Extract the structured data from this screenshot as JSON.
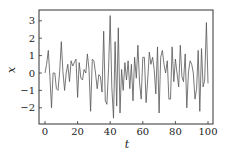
{
  "chart_data": {
    "type": "line",
    "title": "",
    "xlabel": "t",
    "ylabel": "x",
    "xlim": [
      -2,
      103
    ],
    "ylim": [
      -2.95,
      3.6
    ],
    "grid": false,
    "legend": null,
    "x_ticks": [
      0,
      20,
      40,
      60,
      80,
      100
    ],
    "x_tick_labels": [
      "0",
      "20",
      "40",
      "60",
      "80",
      "100"
    ],
    "y_ticks": [
      -2,
      -1,
      0,
      1,
      2,
      3
    ],
    "y_tick_labels": [
      "−2",
      "−1",
      "0",
      "1",
      "2",
      "3"
    ],
    "series": [
      {
        "name": "x(t)",
        "color": "#555555",
        "x": [
          0,
          1,
          2,
          3,
          4,
          5,
          6,
          7,
          8,
          9,
          10,
          11,
          12,
          13,
          14,
          15,
          16,
          17,
          18,
          19,
          20,
          21,
          22,
          23,
          24,
          25,
          26,
          27,
          28,
          29,
          30,
          31,
          32,
          33,
          34,
          35,
          36,
          37,
          38,
          39,
          40,
          41,
          42,
          43,
          44,
          45,
          46,
          47,
          48,
          49,
          50,
          51,
          52,
          53,
          54,
          55,
          56,
          57,
          58,
          59,
          60,
          61,
          62,
          63,
          64,
          65,
          66,
          67,
          68,
          69,
          70,
          71,
          72,
          73,
          74,
          75,
          76,
          77,
          78,
          79,
          80,
          81,
          82,
          83,
          84,
          85,
          86,
          87,
          88,
          89,
          90,
          91,
          92,
          93,
          94,
          95,
          96,
          97,
          98,
          99,
          100
        ],
        "values": [
          0.0,
          0.5,
          1.3,
          -0.2,
          -2.0,
          0.0,
          0.0,
          -0.9,
          -1.0,
          0.1,
          1.8,
          0.1,
          -1.0,
          0.0,
          0.5,
          -0.5,
          0.7,
          0.4,
          0.6,
          0.8,
          -1.4,
          0.6,
          -0.3,
          -0.4,
          0.2,
          0.0,
          1.1,
          0.2,
          -2.2,
          0.8,
          0.7,
          0.0,
          -0.9,
          -0.1,
          -0.2,
          -1.1,
          2.4,
          -1.6,
          -1.8,
          0.3,
          3.3,
          -0.8,
          -2.6,
          1.8,
          -1.9,
          2.6,
          -2.3,
          0.2,
          -1.0,
          0.6,
          -0.4,
          0.7,
          -0.9,
          0.5,
          -1.6,
          0.9,
          -0.3,
          1.6,
          -0.5,
          -1.5,
          0.9,
          0.9,
          -1.7,
          -0.4,
          1.2,
          0.5,
          0.9,
          0.2,
          -1.2,
          1.5,
          -2.3,
          0.9,
          1.3,
          0.5,
          0.0,
          0.7,
          -1.5,
          -1.5,
          1.5,
          -0.5,
          0.8,
          0.0,
          -0.8,
          1.6,
          -0.2,
          -0.5,
          1.1,
          -2.0,
          0.0,
          0.7,
          0.5,
          0.0,
          -1.5,
          -0.9,
          1.3,
          -2.2,
          1.4,
          -0.8,
          -0.4,
          2.9,
          -0.6
        ]
      }
    ]
  }
}
